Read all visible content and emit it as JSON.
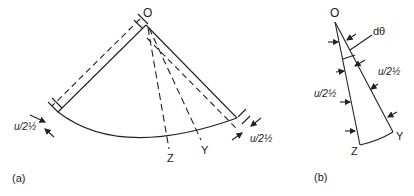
{
  "figure_a": {
    "label": "(a)",
    "apex_label": "O",
    "point_z": "Z",
    "point_y": "Y",
    "offset_label_left": "u/2½",
    "offset_label_right": "u/2½"
  },
  "figure_b": {
    "label": "(b)",
    "apex_label": "O",
    "angle_label": "dθ",
    "point_z": "Z",
    "point_y": "Y",
    "offset_label_left": "u/2½",
    "offset_label_right": "u/2½"
  },
  "colors": {
    "line": "#222222",
    "background": "#ffffff"
  }
}
